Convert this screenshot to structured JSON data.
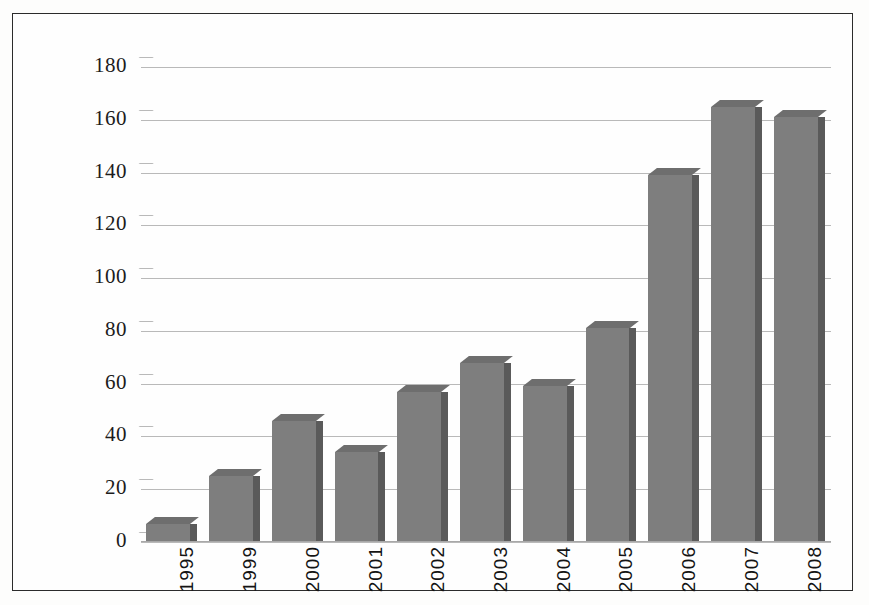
{
  "chart_data": {
    "type": "bar",
    "title": "",
    "subtitle": "",
    "xlabel": "",
    "ylabel": "",
    "categories": [
      "1995",
      "1999",
      "2000",
      "2001",
      "2002",
      "2003",
      "2004",
      "2005",
      "2006",
      "2007",
      "2008"
    ],
    "values": [
      7,
      25,
      46,
      34,
      57,
      68,
      59,
      81,
      139,
      165,
      161
    ],
    "series": [
      {
        "name": "",
        "values": [
          7,
          25,
          46,
          34,
          57,
          68,
          59,
          81,
          139,
          165,
          161
        ]
      }
    ],
    "ylim": [
      0,
      185
    ],
    "yticks": [
      0,
      20,
      40,
      60,
      80,
      100,
      120,
      140,
      160,
      180
    ],
    "ytick_labels": [
      "0",
      "20",
      "40",
      "60",
      "80",
      "100",
      "120",
      "140",
      "160",
      "180"
    ],
    "grid": true,
    "grid_axis": "y",
    "legend": false,
    "legend_position": "none",
    "bar_color": "#7e7e7e",
    "bar_top_color": "#6e6e6e",
    "bar_side_color": "#5a5a5a",
    "grid_color": "#b9b9b9",
    "frame_color": "#2b2b2b",
    "background_color": "#fefefe",
    "style_3d": true,
    "xtick_rotation": 90
  }
}
